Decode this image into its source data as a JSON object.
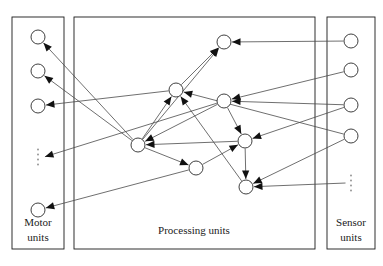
{
  "figure": {
    "background_color": "#ffffff",
    "line_color": "#4a4a4a",
    "node_fill": "#ffffff",
    "node_stroke": "#2b2b2b",
    "arrow_color": "#111111",
    "box_stroke": "#1a1a1a"
  },
  "groups": [
    {
      "id": "motor",
      "label_line1": "Motor",
      "label_line2": "units",
      "box": {
        "x": 12,
        "y": 17,
        "w": 52,
        "h": 232
      },
      "label_x": 38,
      "label_y1": 226,
      "label_y2": 241
    },
    {
      "id": "processing",
      "label_line1": "Processing units",
      "label_line2": "",
      "box": {
        "x": 74,
        "y": 17,
        "w": 241,
        "h": 232
      },
      "label_x": 194,
      "label_y1": 234,
      "label_y2": 0
    },
    {
      "id": "sensor",
      "label_line1": "Sensor",
      "label_line2": "units",
      "box": {
        "x": 327,
        "y": 17,
        "w": 48,
        "h": 232
      },
      "label_x": 351,
      "label_y1": 226,
      "label_y2": 241
    }
  ],
  "nodes": [
    {
      "id": "m1",
      "group": "motor",
      "cx": 38,
      "cy": 37,
      "r": 7
    },
    {
      "id": "m2",
      "group": "motor",
      "cx": 38,
      "cy": 71,
      "r": 7
    },
    {
      "id": "m3",
      "group": "motor",
      "cx": 38,
      "cy": 106,
      "r": 7
    },
    {
      "id": "m4",
      "group": "motor",
      "cx": 38,
      "cy": 210,
      "r": 7
    },
    {
      "id": "p1",
      "group": "processing",
      "cx": 224,
      "cy": 42,
      "r": 7
    },
    {
      "id": "p2",
      "group": "processing",
      "cx": 176,
      "cy": 90,
      "r": 7
    },
    {
      "id": "p3",
      "group": "processing",
      "cx": 224,
      "cy": 101,
      "r": 7
    },
    {
      "id": "p4",
      "group": "processing",
      "cx": 138,
      "cy": 145,
      "r": 7
    },
    {
      "id": "p5",
      "group": "processing",
      "cx": 245,
      "cy": 141,
      "r": 7
    },
    {
      "id": "p6",
      "group": "processing",
      "cx": 196,
      "cy": 168,
      "r": 7
    },
    {
      "id": "p7",
      "group": "processing",
      "cx": 246,
      "cy": 187,
      "r": 7
    },
    {
      "id": "s1",
      "group": "sensor",
      "cx": 351,
      "cy": 41,
      "r": 7
    },
    {
      "id": "s2",
      "group": "sensor",
      "cx": 351,
      "cy": 70,
      "r": 7
    },
    {
      "id": "s3",
      "group": "sensor",
      "cx": 351,
      "cy": 105,
      "r": 7
    },
    {
      "id": "s4",
      "group": "sensor",
      "cx": 351,
      "cy": 136,
      "r": 7
    }
  ],
  "ellipses": [
    {
      "id": "motor-ellipsis",
      "cx": 38,
      "cy": 157,
      "dots": 4,
      "spacing": 5
    },
    {
      "id": "sensor-ellipsis",
      "cx": 351,
      "cy": 183,
      "dots": 4,
      "spacing": 5
    }
  ],
  "edges": [
    {
      "id": "e1",
      "from": "p4",
      "to": "m1"
    },
    {
      "id": "e2",
      "from": "p4",
      "to": "m2"
    },
    {
      "id": "e3",
      "from": "p2",
      "to": "m3"
    },
    {
      "id": "e4",
      "from": "p3",
      "to": "m4_dots"
    },
    {
      "id": "e5",
      "from": "p6",
      "to": "m4"
    },
    {
      "id": "e6",
      "from": "s1",
      "to": "p1"
    },
    {
      "id": "e7",
      "from": "s2",
      "to": "p3"
    },
    {
      "id": "e8",
      "from": "s3",
      "to": "p3"
    },
    {
      "id": "e9",
      "from": "s3",
      "to": "p5"
    },
    {
      "id": "e10",
      "from": "s4",
      "to": "p7"
    },
    {
      "id": "e11",
      "from": "s4",
      "to": "p2"
    },
    {
      "id": "e12",
      "from": "sensor_dots",
      "to": "p7"
    },
    {
      "id": "e13",
      "from": "p2",
      "to": "p1"
    },
    {
      "id": "e14",
      "from": "p4",
      "to": "p1"
    },
    {
      "id": "e15",
      "from": "p4",
      "to": "p2"
    },
    {
      "id": "e16",
      "from": "p3",
      "to": "p4"
    },
    {
      "id": "e17",
      "from": "p5",
      "to": "p4"
    },
    {
      "id": "e18",
      "from": "p4",
      "to": "p6"
    },
    {
      "id": "e19",
      "from": "p6",
      "to": "p5"
    },
    {
      "id": "e20",
      "from": "p3",
      "to": "p5"
    },
    {
      "id": "e21",
      "from": "p5",
      "to": "p7"
    },
    {
      "id": "e22",
      "from": "p7",
      "to": "p2"
    }
  ]
}
